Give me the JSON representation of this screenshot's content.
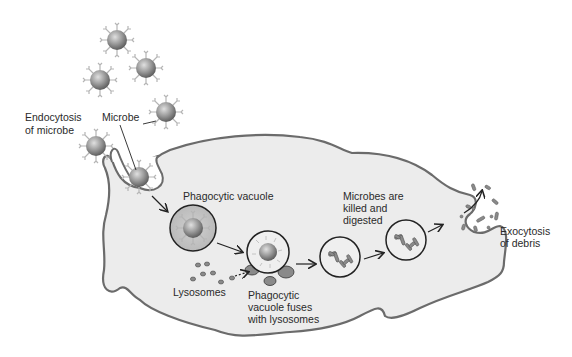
{
  "diagram": {
    "colors": {
      "cell_fill": "#ececec",
      "cell_stroke": "#6b6b6b",
      "microbe_fill": "#8c8c8c",
      "vacuole_stroke": "#222222",
      "lysosome_fill": "#8a8a8a",
      "text": "#2a2a2a"
    },
    "labels": {
      "endocytosis_line1": "Endocytosis",
      "endocytosis_line2": "of microbe",
      "microbe": "Microbe",
      "phagocytic_vacuole": "Phagocytic vacuole",
      "lysosomes": "Lysosomes",
      "fuses_line1": "Phagocytic",
      "fuses_line2": "vacuole fuses",
      "fuses_line3": "with lysosomes",
      "killed_line1": "Microbes are",
      "killed_line2": "killed and",
      "killed_line3": "digested",
      "exocytosis_line1": "Exocytosis",
      "exocytosis_line2": "of debris"
    },
    "stages": [
      "microbe",
      "endocytosis-of-microbe",
      "phagocytic-vacuole",
      "vacuole-fuses-with-lysosomes",
      "microbes-killed-and-digested",
      "exocytosis-of-debris"
    ]
  }
}
